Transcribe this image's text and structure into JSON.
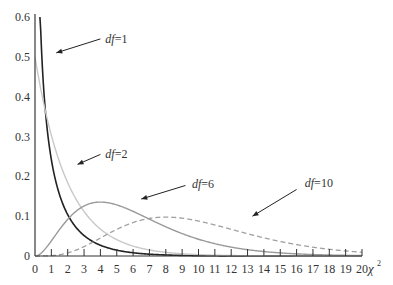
{
  "chart_data": {
    "type": "line",
    "title": "",
    "xlabel": "χ²",
    "ylabel": "",
    "xlim": [
      0,
      20
    ],
    "ylim": [
      0,
      0.6
    ],
    "grid": false,
    "x_ticks": [
      0,
      1,
      2,
      3,
      4,
      5,
      6,
      7,
      8,
      9,
      10,
      11,
      12,
      13,
      14,
      15,
      16,
      17,
      18,
      19,
      20
    ],
    "y_ticks": [
      0,
      0.1,
      0.2,
      0.3,
      0.4,
      0.5,
      0.6
    ],
    "y_tick_labels": [
      "0",
      "0.1",
      "0.2",
      "0.3",
      "0.4",
      "0.5",
      "0.6"
    ],
    "series": [
      {
        "name": "df=1",
        "df": 1,
        "color": "#222222",
        "dash": "",
        "width": 1.6,
        "label": {
          "text": "df=1",
          "x": 4.3,
          "y": 0.545
        },
        "arrow": {
          "from": [
            4.0,
            0.545
          ],
          "to": [
            1.3,
            0.51
          ]
        },
        "peak": {
          "x": 0,
          "y": "∞"
        }
      },
      {
        "name": "df=2",
        "df": 2,
        "color": "#c8c8c8",
        "dash": "",
        "width": 1.4,
        "label": {
          "text": "df=2",
          "x": 4.3,
          "y": 0.257
        },
        "arrow": {
          "from": [
            4.0,
            0.255
          ],
          "to": [
            2.6,
            0.23
          ]
        },
        "peak": {
          "x": 0,
          "y": 0.5
        }
      },
      {
        "name": "df=6",
        "df": 6,
        "color": "#9a9a9a",
        "dash": "",
        "width": 1.4,
        "label": {
          "text": "df=6",
          "x": 9.6,
          "y": 0.18
        },
        "arrow": {
          "from": [
            9.2,
            0.177
          ],
          "to": [
            6.5,
            0.143
          ]
        },
        "peak": {
          "x": 4,
          "y": 0.135
        }
      },
      {
        "name": "df=10",
        "df": 10,
        "color": "#a0a0a0",
        "dash": "5,3",
        "width": 1.3,
        "label": {
          "text": "df=10",
          "x": 16.5,
          "y": 0.183
        },
        "arrow": {
          "from": [
            16.0,
            0.167
          ],
          "to": [
            13.3,
            0.1
          ]
        },
        "peak": {
          "x": 8,
          "y": 0.098
        }
      }
    ]
  }
}
